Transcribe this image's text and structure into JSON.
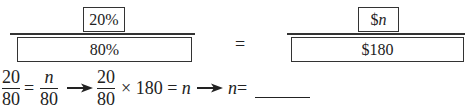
{
  "proportion_diagram": {
    "left_ratio": {
      "part_label": "20%",
      "whole_label": "80%"
    },
    "equals": "=",
    "right_ratio": {
      "part_prefix": "$",
      "part_var": "n",
      "whole_label": "$180"
    }
  },
  "equation_chain": {
    "step1": {
      "lhs_num": "20",
      "lhs_den": "80",
      "equals": "=",
      "rhs_num": "n",
      "rhs_den": "80"
    },
    "step2": {
      "num": "20",
      "den": "80",
      "times": "×",
      "factor": "180",
      "equals": "=",
      "result": "n"
    },
    "step3": {
      "var": "n",
      "equals": "=",
      "answer_blank": ""
    }
  }
}
